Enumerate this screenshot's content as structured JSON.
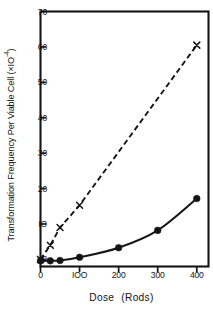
{
  "chart_data": {
    "type": "line",
    "title": "",
    "xlabel": "Dose   (Rads)",
    "ylabel": "Transformation Frequency Per Viable Cell  (×10⁻⁴)",
    "xlim": [
      0,
      430
    ],
    "ylim": [
      -2,
      70
    ],
    "xticks": [
      0,
      100,
      200,
      300,
      400
    ],
    "xtick_labels": [
      "0",
      "IOO",
      "200",
      "300",
      "400"
    ],
    "yticks": [
      0,
      10,
      20,
      30,
      40,
      50,
      60,
      70
    ],
    "ytick_labels": [
      "0",
      "IO",
      "20",
      "30",
      "40",
      "50",
      "60",
      "70"
    ],
    "grid": false,
    "legend": "none",
    "frame": "box",
    "series": [
      {
        "name": "x-marker-series",
        "marker": "x",
        "linestyle": "dashed",
        "color": "#141414",
        "x": [
          0,
          25,
          50,
          100,
          400
        ],
        "y": [
          0,
          4.0,
          9.0,
          15.3,
          60.5
        ]
      },
      {
        "name": "filled-circle-series",
        "marker": "circle",
        "linestyle": "solid",
        "color": "#141414",
        "x": [
          0,
          25,
          50,
          100,
          200,
          300,
          400
        ],
        "y": [
          -0.4,
          -0.4,
          -0.3,
          0.6,
          3.3,
          8.2,
          17.2
        ]
      }
    ]
  },
  "axis": {
    "ylabel_main": "Transformation Frequency Per Viable Cell  (×IO",
    "ylabel_exp": "-4",
    "ylabel_close": ")",
    "xlabel_word1": "Dose",
    "xlabel_word2": "(Rods)"
  }
}
